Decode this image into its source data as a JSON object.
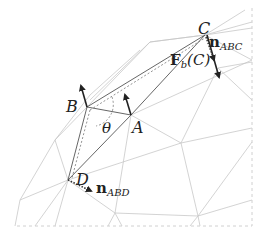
{
  "diagram": {
    "type": "triangle-mesh-bending-force",
    "vertices": {
      "A": {
        "label": "A"
      },
      "B": {
        "label": "B"
      },
      "C": {
        "label": "C"
      },
      "D": {
        "label": "D"
      }
    },
    "angle_label": "θ",
    "force_label": {
      "main": "F",
      "sub": "b",
      "arg": "(C)"
    },
    "normal_abc": {
      "main": "n",
      "sub": "ABC"
    },
    "normal_abd": {
      "main": "n",
      "sub": "ABD"
    },
    "colors": {
      "mesh": "#c8c8c8",
      "edges": "#555555",
      "arrows": "#222222",
      "border": "#d0d0d0"
    }
  }
}
